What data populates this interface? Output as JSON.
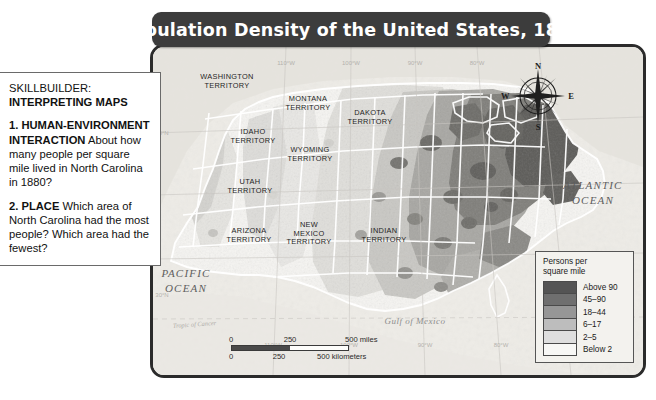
{
  "title": {
    "text": "Population Density of the United States, 1880"
  },
  "skillbuilder": {
    "heading_label": "SKILLBUILDER:",
    "heading_bold": "INTERPRETING MAPS",
    "q1_label": "1. HUMAN-ENVIRONMENT INTERACTION",
    "q1_text": "About how many people per square mile lived in North Carolina in 1880?",
    "q2_label": "2. PLACE",
    "q2_text": "Which area of North Carolina had the most people? Which area had the fewest?"
  },
  "legend": {
    "title_line1": "Persons per",
    "title_line2": "square mile",
    "entries": [
      {
        "label": "Above 90",
        "color": "#545454"
      },
      {
        "label": "45–90",
        "color": "#6f6f6f"
      },
      {
        "label": "18–44",
        "color": "#969696"
      },
      {
        "label": "6–17",
        "color": "#bdbdbd"
      },
      {
        "label": "2–5",
        "color": "#dedede"
      },
      {
        "label": "Below 2",
        "color": "#f7f7f5"
      }
    ]
  },
  "scale": {
    "miles": {
      "t0": "0",
      "t1": "250",
      "t2": "500 miles"
    },
    "kilometers": {
      "t0": "0",
      "t1": "250",
      "t2": "500 kilometers"
    }
  },
  "compass": {
    "north": "N",
    "east": "E",
    "south": "S",
    "west": "W"
  },
  "map_labels": {
    "territories": [
      {
        "name": "washington-territory",
        "line1": "WASHINGTON",
        "line2": "TERRITORY",
        "x": 74,
        "y": 32
      },
      {
        "name": "montana-territory",
        "line1": "MONTANA",
        "line2": "TERRITORY",
        "x": 155,
        "y": 54
      },
      {
        "name": "dakota-territory",
        "line1": "DAKOTA",
        "line2": "TERRITORY",
        "x": 217,
        "y": 68
      },
      {
        "name": "idaho-territory",
        "line1": "IDAHO",
        "line2": "TERRITORY",
        "x": 100,
        "y": 87
      },
      {
        "name": "wyoming-territory",
        "line1": "WYOMING",
        "line2": "TERRITORY",
        "x": 157,
        "y": 105
      },
      {
        "name": "utah-territory",
        "line1": "UTAH",
        "line2": "TERRITORY",
        "x": 97,
        "y": 137
      },
      {
        "name": "arizona-territory",
        "line1": "ARIZONA",
        "line2": "TERRITORY",
        "x": 96,
        "y": 186
      },
      {
        "name": "new-mexico-territory",
        "line1": "NEW",
        "line2": "MEXICO",
        "line3": "TERRITORY",
        "x": 156,
        "y": 180
      },
      {
        "name": "indian-territory",
        "line1": "INDIAN",
        "line2": "TERRITORY",
        "x": 231,
        "y": 186
      }
    ],
    "oceans": [
      {
        "name": "atlantic-ocean",
        "line1": "ATLANTIC",
        "line2": "OCEAN",
        "x": 440,
        "y": 142
      },
      {
        "name": "pacific-ocean",
        "line1": "PACIFIC",
        "line2": "OCEAN",
        "x": 33,
        "y": 230
      }
    ],
    "gulf": {
      "text": "Gulf of Mexico",
      "x": 262,
      "y": 277
    },
    "tropic": {
      "text": "Tropic of Cancer",
      "x": 20,
      "y": 281
    },
    "longitude": [
      {
        "text": "110°W",
        "x": 133,
        "y": 18
      },
      {
        "text": "100°W",
        "x": 198,
        "y": 18
      },
      {
        "text": "90°W",
        "x": 262,
        "y": 18
      },
      {
        "text": "80°W",
        "x": 324,
        "y": 18
      }
    ],
    "longitude_bottom": [
      {
        "text": "110°W",
        "x": 120,
        "y": 300
      },
      {
        "text": "100°W",
        "x": 196,
        "y": 300
      },
      {
        "text": "90°W",
        "x": 272,
        "y": 300
      },
      {
        "text": "80°W",
        "x": 348,
        "y": 300
      },
      {
        "text": "70°W",
        "x": 418,
        "y": 300
      }
    ],
    "latitude": [
      {
        "text": "40°N",
        "x": 9,
        "y": 88
      },
      {
        "text": "30°N",
        "x": 9,
        "y": 250
      }
    ]
  }
}
